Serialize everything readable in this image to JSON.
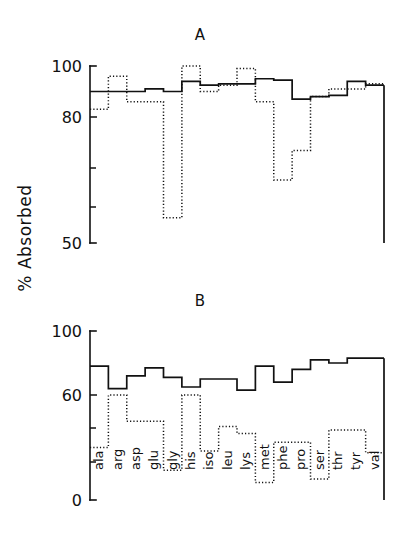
{
  "figure": {
    "axis_title": "% Absorbed",
    "panels": [
      {
        "id": "A",
        "label": "A"
      },
      {
        "id": "B",
        "label": "B"
      }
    ]
  },
  "chart_data": [
    {
      "type": "line",
      "panel": "A",
      "title": "A",
      "xlabel": "",
      "ylabel": "% Absorbed",
      "ylim": [
        50,
        100
      ],
      "ytick_labels": [
        "100",
        "80",
        "50"
      ],
      "ytick_values": [
        100,
        80,
        50
      ],
      "yticks_minor_count": 2,
      "grid": false,
      "legend": "none",
      "step_style": "post",
      "categories": [
        "ala",
        "arg",
        "asp",
        "glu",
        "gly",
        "his",
        "iso",
        "leu",
        "lys",
        "met",
        "phe",
        "pro",
        "ser",
        "thr",
        "tyr",
        "val"
      ],
      "series": [
        {
          "name": "solid",
          "style": "solid",
          "values": [
            90,
            90,
            90,
            91,
            90,
            94,
            92.5,
            93,
            93,
            95,
            94.5,
            87,
            88,
            88.5,
            94,
            92.5
          ]
        },
        {
          "name": "dotted",
          "style": "dotted",
          "values": [
            83,
            96,
            86,
            86,
            56,
            100,
            90,
            92.5,
            99,
            86,
            65,
            72,
            88,
            91,
            91,
            93
          ]
        }
      ]
    },
    {
      "type": "line",
      "panel": "B",
      "title": "B",
      "xlabel": "",
      "ylabel": "% Absorbed",
      "ylim": [
        0,
        100
      ],
      "ytick_labels": [
        "100",
        "60",
        "0"
      ],
      "ytick_values": [
        100,
        60,
        0
      ],
      "yticks_minor_count": 2,
      "grid": false,
      "legend": "none",
      "step_style": "post",
      "categories": [
        "ala",
        "arg",
        "asp",
        "glu",
        "gly",
        "his",
        "iso",
        "leu",
        "lys",
        "met",
        "phe",
        "pro",
        "ser",
        "thr",
        "tyr",
        "val"
      ],
      "series": [
        {
          "name": "solid",
          "style": "solid",
          "values": [
            78,
            64,
            72,
            77,
            71,
            65,
            70,
            70,
            63,
            78,
            68,
            76,
            82,
            80,
            83,
            83
          ]
        },
        {
          "name": "dotted",
          "style": "dotted",
          "values": [
            30,
            60,
            45,
            45,
            17,
            60,
            28,
            42,
            38,
            10,
            33,
            33,
            12,
            40,
            40,
            27
          ]
        }
      ]
    }
  ]
}
